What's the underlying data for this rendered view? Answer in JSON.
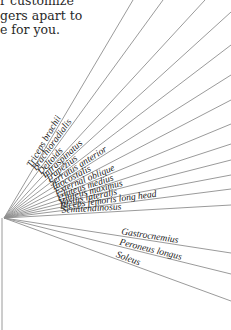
{
  "intro": {
    "lines": [
      "r customize",
      "gers apart to",
      "e for you."
    ]
  },
  "diagram": {
    "origin": [
      4,
      218
    ],
    "stem_bottom": 330,
    "line_color": "#8f8f8f",
    "rays": [
      {
        "label": "Triceps brachii",
        "end": [
          133,
          0
        ]
      },
      {
        "label": "Brachioradialis",
        "end": [
          163,
          0
        ]
      },
      {
        "label": "Deltoids",
        "end": [
          205,
          0
        ]
      },
      {
        "label": "Infraspinatus",
        "end": [
          231,
          12
        ]
      },
      {
        "label": "Trapezius",
        "end": [
          231,
          45
        ]
      },
      {
        "label": "Serratus anterior",
        "end": [
          231,
          75
        ]
      },
      {
        "label": "Iliocostalis",
        "end": [
          231,
          100
        ]
      },
      {
        "label": "External oblique",
        "end": [
          231,
          124
        ]
      },
      {
        "label": "Gluteus medius",
        "end": [
          231,
          144
        ]
      },
      {
        "label": "Gluteus maximus",
        "end": [
          231,
          160
        ]
      },
      {
        "label": "Vastus lateralis",
        "end": [
          231,
          175
        ]
      },
      {
        "label": "Biceps femoris long head",
        "end": [
          231,
          189
        ]
      },
      {
        "label": "Semitendinosus",
        "end": [
          231,
          205
        ]
      },
      {
        "label": "Gastrocnemius",
        "end": [
          231,
          253
        ]
      },
      {
        "label": "Peroneus longus",
        "end": [
          231,
          274
        ]
      },
      {
        "label": "Soleus",
        "end": [
          231,
          301
        ]
      }
    ]
  }
}
